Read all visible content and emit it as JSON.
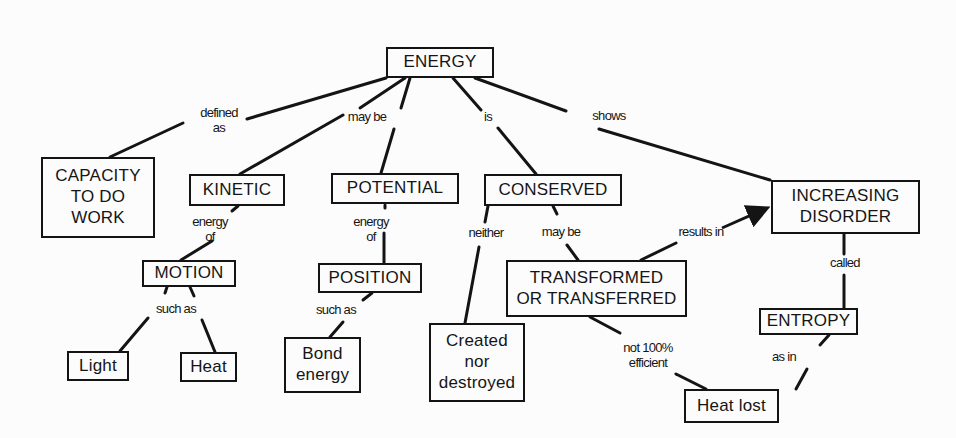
{
  "colors": {
    "background": "#fcfcfc",
    "ink": "#141414"
  },
  "nodes": [
    {
      "id": "energy",
      "label": "ENERGY",
      "x": 386,
      "y": 47,
      "w": 108,
      "h": 31
    },
    {
      "id": "capacity",
      "label": "CAPACITY\nTO DO\nWORK",
      "x": 41,
      "y": 157,
      "w": 114,
      "h": 81
    },
    {
      "id": "kinetic",
      "label": "KINETIC",
      "x": 189,
      "y": 174,
      "w": 96,
      "h": 32
    },
    {
      "id": "potential",
      "label": "POTENTIAL",
      "x": 331,
      "y": 173,
      "w": 128,
      "h": 31
    },
    {
      "id": "conserved",
      "label": "CONSERVED",
      "x": 484,
      "y": 174,
      "w": 138,
      "h": 32
    },
    {
      "id": "disorder",
      "label": "INCREASING\nDISORDER",
      "x": 771,
      "y": 180,
      "w": 149,
      "h": 54
    },
    {
      "id": "motion",
      "label": "MOTION",
      "x": 142,
      "y": 260,
      "w": 94,
      "h": 27
    },
    {
      "id": "position",
      "label": "POSITION",
      "x": 318,
      "y": 263,
      "w": 104,
      "h": 30
    },
    {
      "id": "transformed",
      "label": "TRANSFORMED\nOR TRANSFERRED",
      "x": 506,
      "y": 260,
      "w": 181,
      "h": 57
    },
    {
      "id": "light",
      "label": "Light",
      "x": 67,
      "y": 351,
      "w": 62,
      "h": 30
    },
    {
      "id": "heat",
      "label": "Heat",
      "x": 180,
      "y": 352,
      "w": 57,
      "h": 30
    },
    {
      "id": "bond",
      "label": "Bond\nenergy",
      "x": 284,
      "y": 337,
      "w": 77,
      "h": 56
    },
    {
      "id": "created",
      "label": "Created\nnor\ndestroyed",
      "x": 429,
      "y": 323,
      "w": 96,
      "h": 79
    },
    {
      "id": "entropy",
      "label": "ENTROPY",
      "x": 759,
      "y": 308,
      "w": 99,
      "h": 27
    },
    {
      "id": "heatlost",
      "label": "Heat lost",
      "x": 684,
      "y": 389,
      "w": 95,
      "h": 34
    }
  ],
  "link_labels": [
    {
      "id": "defined-as",
      "label": "defined\nas",
      "x": 219,
      "y": 121
    },
    {
      "id": "may-be-1",
      "label": "may be",
      "x": 367,
      "y": 117
    },
    {
      "id": "is",
      "label": "is",
      "x": 488,
      "y": 117
    },
    {
      "id": "shows",
      "label": "shows",
      "x": 609,
      "y": 116
    },
    {
      "id": "energy-of-1",
      "label": "energy\nof",
      "x": 210,
      "y": 230
    },
    {
      "id": "energy-of-2",
      "label": "energy\nof",
      "x": 371,
      "y": 230
    },
    {
      "id": "neither",
      "label": "neither",
      "x": 486,
      "y": 233
    },
    {
      "id": "may-be-2",
      "label": "may be",
      "x": 561,
      "y": 232
    },
    {
      "id": "results-in",
      "label": "results in",
      "x": 701,
      "y": 232
    },
    {
      "id": "such-as-1",
      "label": "such as",
      "x": 176,
      "y": 309
    },
    {
      "id": "such-as-2",
      "label": "such as",
      "x": 336,
      "y": 310
    },
    {
      "id": "called",
      "label": "called",
      "x": 845,
      "y": 263
    },
    {
      "id": "not-100",
      "label": "not 100%\nefficient",
      "x": 648,
      "y": 356
    },
    {
      "id": "as-in",
      "label": "as in",
      "x": 784,
      "y": 357
    }
  ],
  "edges": [
    {
      "id": "e1",
      "points": [
        [
          386,
          78
        ],
        [
          247,
          119
        ]
      ]
    },
    {
      "id": "e2",
      "points": [
        [
          183,
          123
        ],
        [
          110,
          157
        ]
      ]
    },
    {
      "id": "e3",
      "points": [
        [
          405,
          78
        ],
        [
          360,
          108
        ]
      ]
    },
    {
      "id": "e4",
      "points": [
        [
          343,
          115
        ],
        [
          240,
          174
        ]
      ]
    },
    {
      "id": "e5",
      "points": [
        [
          410,
          78
        ],
        [
          401,
          108
        ]
      ]
    },
    {
      "id": "e6",
      "points": [
        [
          394,
          129
        ],
        [
          381,
          173
        ]
      ]
    },
    {
      "id": "e7",
      "points": [
        [
          453,
          78
        ],
        [
          481,
          110
        ]
      ]
    },
    {
      "id": "e8",
      "points": [
        [
          498,
          128
        ],
        [
          536,
          174
        ]
      ]
    },
    {
      "id": "e9",
      "points": [
        [
          475,
          78
        ],
        [
          566,
          111
        ]
      ]
    },
    {
      "id": "e10",
      "points": [
        [
          599,
          129
        ],
        [
          770,
          180
        ]
      ]
    },
    {
      "id": "e11",
      "points": [
        [
          238,
          206
        ],
        [
          232,
          211
        ]
      ]
    },
    {
      "id": "e12",
      "points": [
        [
          212,
          241
        ],
        [
          181,
          260
        ]
      ]
    },
    {
      "id": "e13",
      "points": [
        [
          385,
          205
        ],
        [
          385,
          208
        ]
      ]
    },
    {
      "id": "e14",
      "points": [
        [
          384,
          233
        ],
        [
          384,
          263
        ]
      ]
    },
    {
      "id": "e15",
      "points": [
        [
          488,
          206
        ],
        [
          485,
          222
        ]
      ]
    },
    {
      "id": "e16",
      "points": [
        [
          479,
          247
        ],
        [
          465,
          323
        ]
      ]
    },
    {
      "id": "e17",
      "points": [
        [
          553,
          206
        ],
        [
          557,
          214
        ]
      ]
    },
    {
      "id": "e18",
      "points": [
        [
          567,
          245
        ],
        [
          578,
          260
        ]
      ]
    },
    {
      "id": "e19",
      "points": [
        [
          641,
          260
        ],
        [
          676,
          243
        ]
      ]
    },
    {
      "id": "e20",
      "points": [
        [
          167,
          287
        ],
        [
          165,
          293
        ]
      ]
    },
    {
      "id": "e21",
      "points": [
        [
          190,
          287
        ],
        [
          194,
          296
        ]
      ]
    },
    {
      "id": "e22",
      "points": [
        [
          148,
          318
        ],
        [
          120,
          351
        ]
      ]
    },
    {
      "id": "e23",
      "points": [
        [
          202,
          320
        ],
        [
          215,
          352
        ]
      ]
    },
    {
      "id": "e24",
      "points": [
        [
          372,
          293
        ],
        [
          363,
          300
        ]
      ]
    },
    {
      "id": "e25",
      "points": [
        [
          343,
          322
        ],
        [
          330,
          337
        ]
      ]
    },
    {
      "id": "e26",
      "points": [
        [
          844,
          234
        ],
        [
          844,
          254
        ]
      ]
    },
    {
      "id": "e27",
      "points": [
        [
          844,
          275
        ],
        [
          844,
          308
        ]
      ]
    },
    {
      "id": "e28",
      "points": [
        [
          590,
          317
        ],
        [
          620,
          333
        ]
      ]
    },
    {
      "id": "e29",
      "points": [
        [
          676,
          374
        ],
        [
          706,
          389
        ]
      ]
    },
    {
      "id": "e30",
      "points": [
        [
          829,
          335
        ],
        [
          820,
          345
        ]
      ]
    },
    {
      "id": "e31",
      "points": [
        [
          807,
          369
        ],
        [
          796,
          389
        ]
      ]
    }
  ],
  "arrows": [
    {
      "id": "results-in-arrow",
      "from": [
        722,
        228
      ],
      "to": [
        771,
        206
      ]
    }
  ]
}
